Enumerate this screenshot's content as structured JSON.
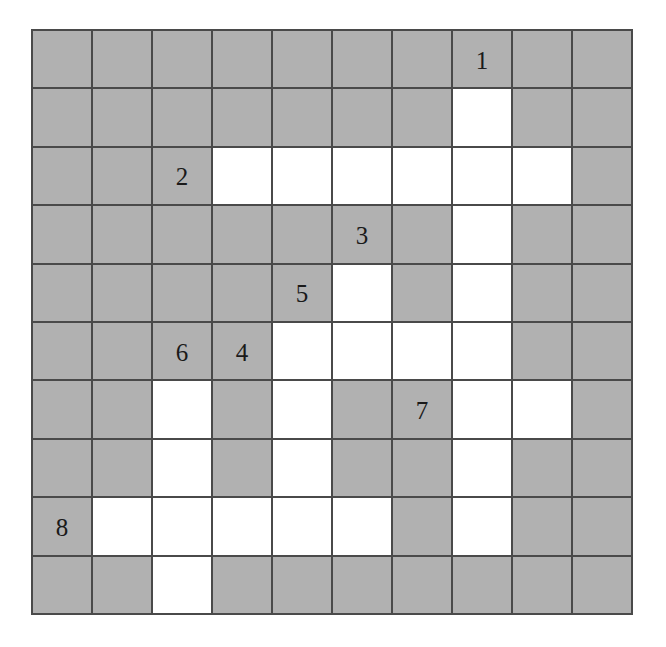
{
  "puzzle": {
    "type": "crossword-grid",
    "rows": 10,
    "cols": 10,
    "colors": {
      "filled_cell": "#b1b1b1",
      "open_cell": "#ffffff",
      "grid_line": "#4a4a4a",
      "number_text": "#1a1a1a",
      "page_background": "#ffffff"
    },
    "legend": {
      "filled_label": "shaded",
      "open_label": "blank"
    },
    "clue_numbers": [
      {
        "number": "1",
        "row": 0,
        "col": 7
      },
      {
        "number": "2",
        "row": 2,
        "col": 2
      },
      {
        "number": "3",
        "row": 3,
        "col": 5
      },
      {
        "number": "5",
        "row": 4,
        "col": 4
      },
      {
        "number": "6",
        "row": 5,
        "col": 2
      },
      {
        "number": "4",
        "row": 5,
        "col": 3
      },
      {
        "number": "7",
        "row": 6,
        "col": 6
      },
      {
        "number": "8",
        "row": 8,
        "col": 0
      }
    ],
    "cells": [
      [
        {
          "state": "filled",
          "number": null
        },
        {
          "state": "filled",
          "number": null
        },
        {
          "state": "filled",
          "number": null
        },
        {
          "state": "filled",
          "number": null
        },
        {
          "state": "filled",
          "number": null
        },
        {
          "state": "filled",
          "number": null
        },
        {
          "state": "filled",
          "number": null
        },
        {
          "state": "filled",
          "number": "1"
        },
        {
          "state": "filled",
          "number": null
        },
        {
          "state": "filled",
          "number": null
        }
      ],
      [
        {
          "state": "filled",
          "number": null
        },
        {
          "state": "filled",
          "number": null
        },
        {
          "state": "filled",
          "number": null
        },
        {
          "state": "filled",
          "number": null
        },
        {
          "state": "filled",
          "number": null
        },
        {
          "state": "filled",
          "number": null
        },
        {
          "state": "filled",
          "number": null
        },
        {
          "state": "open",
          "number": null
        },
        {
          "state": "filled",
          "number": null
        },
        {
          "state": "filled",
          "number": null
        }
      ],
      [
        {
          "state": "filled",
          "number": null
        },
        {
          "state": "filled",
          "number": null
        },
        {
          "state": "filled",
          "number": "2"
        },
        {
          "state": "open",
          "number": null
        },
        {
          "state": "open",
          "number": null
        },
        {
          "state": "open",
          "number": null
        },
        {
          "state": "open",
          "number": null
        },
        {
          "state": "open",
          "number": null
        },
        {
          "state": "open",
          "number": null
        },
        {
          "state": "filled",
          "number": null
        }
      ],
      [
        {
          "state": "filled",
          "number": null
        },
        {
          "state": "filled",
          "number": null
        },
        {
          "state": "filled",
          "number": null
        },
        {
          "state": "filled",
          "number": null
        },
        {
          "state": "filled",
          "number": null
        },
        {
          "state": "filled",
          "number": "3"
        },
        {
          "state": "filled",
          "number": null
        },
        {
          "state": "open",
          "number": null
        },
        {
          "state": "filled",
          "number": null
        },
        {
          "state": "filled",
          "number": null
        }
      ],
      [
        {
          "state": "filled",
          "number": null
        },
        {
          "state": "filled",
          "number": null
        },
        {
          "state": "filled",
          "number": null
        },
        {
          "state": "filled",
          "number": null
        },
        {
          "state": "filled",
          "number": "5"
        },
        {
          "state": "open",
          "number": null
        },
        {
          "state": "filled",
          "number": null
        },
        {
          "state": "open",
          "number": null
        },
        {
          "state": "filled",
          "number": null
        },
        {
          "state": "filled",
          "number": null
        }
      ],
      [
        {
          "state": "filled",
          "number": null
        },
        {
          "state": "filled",
          "number": null
        },
        {
          "state": "filled",
          "number": "6"
        },
        {
          "state": "filled",
          "number": "4"
        },
        {
          "state": "open",
          "number": null
        },
        {
          "state": "open",
          "number": null
        },
        {
          "state": "open",
          "number": null
        },
        {
          "state": "open",
          "number": null
        },
        {
          "state": "filled",
          "number": null
        },
        {
          "state": "filled",
          "number": null
        }
      ],
      [
        {
          "state": "filled",
          "number": null
        },
        {
          "state": "filled",
          "number": null
        },
        {
          "state": "open",
          "number": null
        },
        {
          "state": "filled",
          "number": null
        },
        {
          "state": "open",
          "number": null
        },
        {
          "state": "filled",
          "number": null
        },
        {
          "state": "filled",
          "number": "7"
        },
        {
          "state": "open",
          "number": null
        },
        {
          "state": "open",
          "number": null
        },
        {
          "state": "filled",
          "number": null
        }
      ],
      [
        {
          "state": "filled",
          "number": null
        },
        {
          "state": "filled",
          "number": null
        },
        {
          "state": "open",
          "number": null
        },
        {
          "state": "filled",
          "number": null
        },
        {
          "state": "open",
          "number": null
        },
        {
          "state": "filled",
          "number": null
        },
        {
          "state": "filled",
          "number": null
        },
        {
          "state": "open",
          "number": null
        },
        {
          "state": "filled",
          "number": null
        },
        {
          "state": "filled",
          "number": null
        }
      ],
      [
        {
          "state": "filled",
          "number": "8"
        },
        {
          "state": "open",
          "number": null
        },
        {
          "state": "open",
          "number": null
        },
        {
          "state": "open",
          "number": null
        },
        {
          "state": "open",
          "number": null
        },
        {
          "state": "open",
          "number": null
        },
        {
          "state": "filled",
          "number": null
        },
        {
          "state": "open",
          "number": null
        },
        {
          "state": "filled",
          "number": null
        },
        {
          "state": "filled",
          "number": null
        }
      ],
      [
        {
          "state": "filled",
          "number": null
        },
        {
          "state": "filled",
          "number": null
        },
        {
          "state": "open",
          "number": null
        },
        {
          "state": "filled",
          "number": null
        },
        {
          "state": "filled",
          "number": null
        },
        {
          "state": "filled",
          "number": null
        },
        {
          "state": "filled",
          "number": null
        },
        {
          "state": "filled",
          "number": null
        },
        {
          "state": "filled",
          "number": null
        },
        {
          "state": "filled",
          "number": null
        }
      ]
    ]
  }
}
